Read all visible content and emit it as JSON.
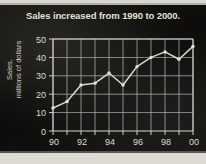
{
  "chart_data": {
    "type": "line",
    "title": "Sales increased from 1990 to 2000.",
    "xlabel": "",
    "ylabel": "Sales, millions of dollars",
    "ylabel_line1": "Sales,",
    "ylabel_line2": "millions of dollars",
    "x": [
      1990,
      1991,
      1992,
      1993,
      1994,
      1995,
      1996,
      1997,
      1998,
      1999,
      2000
    ],
    "categories": [
      "90",
      "91",
      "92",
      "93",
      "94",
      "95",
      "96",
      "97",
      "98",
      "99",
      "00"
    ],
    "values": [
      12.5,
      16,
      25,
      26,
      31.5,
      25,
      35,
      40,
      43,
      39,
      46
    ],
    "series": [
      {
        "name": "Sales",
        "values": [
          12.5,
          16,
          25,
          26,
          31.5,
          25,
          35,
          40,
          43,
          39,
          46
        ]
      }
    ],
    "xlim": [
      1990,
      2000
    ],
    "ylim": [
      0,
      50
    ],
    "ytick_labels": [
      "0",
      "10",
      "20",
      "30",
      "40",
      "50"
    ],
    "ytick_values": [
      0,
      10,
      20,
      30,
      40,
      50
    ],
    "xtick_labels": [
      "90",
      "92",
      "94",
      "96",
      "98",
      "00"
    ],
    "xtick_values": [
      1990,
      1992,
      1994,
      1996,
      1998,
      2000
    ],
    "xtick_minor_values": [
      1991,
      1993,
      1995,
      1997,
      1999
    ],
    "grid": true,
    "grid_style": "both-axes",
    "legend": false,
    "legend_position": "none",
    "markers": true,
    "colors": {
      "background": "#0a0a0a",
      "line": "#dcdad0",
      "grid": "#b8b6ac",
      "text": "#dedcd2",
      "title": "#e8e6dc",
      "page": "#d8d8d0"
    }
  }
}
